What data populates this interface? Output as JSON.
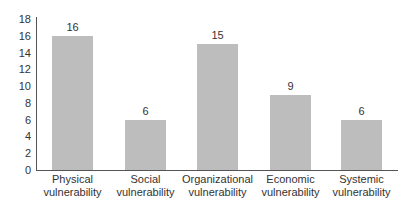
{
  "chart_data": {
    "type": "bar",
    "title": "",
    "xlabel": "",
    "ylabel": "",
    "ylim": [
      0,
      18
    ],
    "yticks": [
      0,
      2,
      4,
      6,
      8,
      10,
      12,
      14,
      16,
      18
    ],
    "grid": false,
    "legend": null,
    "categories": [
      "Physical vulnerability",
      "Social vulnerability",
      "Organizational vulnerability",
      "Economic vulnerability",
      "Systemic vulnerability"
    ],
    "category_lines": [
      [
        "Physical",
        "vulnerability"
      ],
      [
        "Social",
        "vulnerability"
      ],
      [
        "Organizational",
        "vulnerability"
      ],
      [
        "Economic",
        "vulnerability"
      ],
      [
        "Systemic",
        "vulnerability"
      ]
    ],
    "values": [
      16,
      6,
      15,
      9,
      6
    ],
    "value_labels": [
      "16",
      "6",
      "15",
      "9",
      "6"
    ],
    "bar_color": "#bdbdbd"
  }
}
